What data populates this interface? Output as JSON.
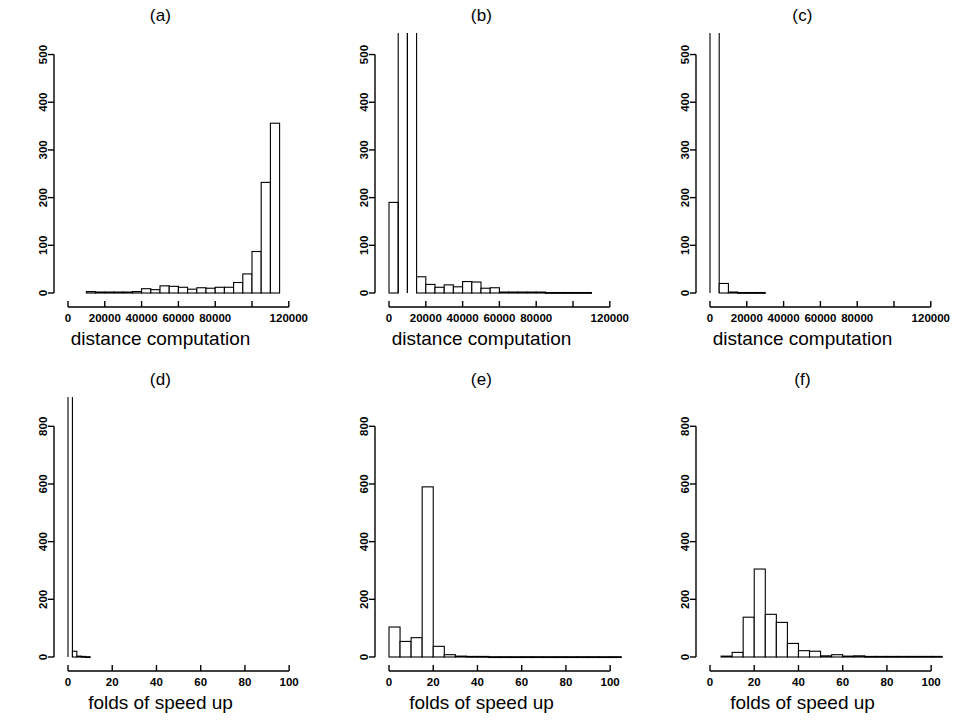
{
  "figure": {
    "background": "#ffffff",
    "axis_color": "#000000",
    "bar_fill": "#ffffff",
    "bar_stroke": "#000000",
    "width": 963,
    "height": 727
  },
  "panels": [
    {
      "id": "a",
      "title": "(a)"
    },
    {
      "id": "b",
      "title": "(b)"
    },
    {
      "id": "c",
      "title": "(c)"
    },
    {
      "id": "d",
      "title": "(d)"
    },
    {
      "id": "e",
      "title": "(e)"
    },
    {
      "id": "f",
      "title": "(f)"
    }
  ],
  "axis_labels": {
    "top_row_x": "distance computation",
    "bottom_row_x": "folds of speed up"
  },
  "chart_data": [
    {
      "type": "bar",
      "title": "(a)",
      "xlabel": "distance computation",
      "ylabel": "",
      "xlim": [
        0,
        125000
      ],
      "ylim": [
        0,
        520
      ],
      "xticks": [
        0,
        20000,
        40000,
        60000,
        80000,
        100000,
        120000
      ],
      "xtick_labels": [
        "0",
        "20000",
        "40000",
        "60000",
        "80000",
        "",
        "120000"
      ],
      "yticks": [
        0,
        100,
        200,
        300,
        400,
        500
      ],
      "ytick_labels": [
        "0",
        "100",
        "200",
        "300",
        "400",
        "500"
      ],
      "grid": false,
      "bin_width": 5000,
      "bin_starts": [
        10000,
        15000,
        20000,
        25000,
        30000,
        35000,
        40000,
        45000,
        50000,
        55000,
        60000,
        65000,
        70000,
        75000,
        80000,
        85000,
        90000,
        95000,
        100000,
        105000,
        110000
      ],
      "values": [
        3,
        2,
        2,
        2,
        2,
        3,
        9,
        7,
        15,
        14,
        12,
        8,
        11,
        10,
        12,
        12,
        22,
        40,
        87,
        232,
        356,
        5
      ]
    },
    {
      "type": "bar",
      "title": "(b)",
      "xlabel": "distance computation",
      "ylabel": "",
      "xlim": [
        0,
        125000
      ],
      "ylim": [
        0,
        520
      ],
      "xticks": [
        0,
        20000,
        40000,
        60000,
        80000,
        100000,
        120000
      ],
      "xtick_labels": [
        "0",
        "20000",
        "40000",
        "60000",
        "80000",
        "",
        "120000"
      ],
      "yticks": [
        0,
        100,
        200,
        300,
        400,
        500
      ],
      "ytick_labels": [
        "0",
        "100",
        "200",
        "300",
        "400",
        "500"
      ],
      "grid": false,
      "bin_width": 5000,
      "bin_starts": [
        0,
        5000,
        10000,
        15000,
        20000,
        25000,
        30000,
        35000,
        40000,
        45000,
        50000,
        55000,
        60000,
        65000,
        70000,
        75000,
        80000,
        85000,
        90000,
        95000,
        100000,
        105000
      ],
      "values": [
        190,
        900,
        900,
        34,
        18,
        12,
        17,
        13,
        24,
        23,
        10,
        11,
        2,
        2,
        2,
        2,
        2,
        1,
        1,
        1,
        1,
        1
      ],
      "clipped_bars": [
        1,
        2
      ],
      "note": "two bars exceed the plotted y range and are clipped at the top"
    },
    {
      "type": "bar",
      "title": "(c)",
      "xlabel": "distance computation",
      "ylabel": "",
      "xlim": [
        0,
        125000
      ],
      "ylim": [
        0,
        520
      ],
      "xticks": [
        0,
        20000,
        40000,
        60000,
        80000,
        100000,
        120000
      ],
      "xtick_labels": [
        "0",
        "20000",
        "40000",
        "60000",
        "80000",
        "",
        "120000"
      ],
      "yticks": [
        0,
        100,
        200,
        300,
        400,
        500
      ],
      "ytick_labels": [
        "0",
        "100",
        "200",
        "300",
        "400",
        "500"
      ],
      "grid": false,
      "bin_width": 5000,
      "bin_starts": [
        0,
        5000,
        10000,
        15000,
        20000,
        25000
      ],
      "values": [
        1100,
        20,
        2,
        1,
        1,
        1
      ],
      "clipped_bars": [
        0
      ],
      "note": "first bar exceeds the plotted y range and is clipped at the top"
    },
    {
      "type": "bar",
      "title": "(d)",
      "xlabel": "folds of speed up",
      "ylabel": "",
      "xlim": [
        0,
        104
      ],
      "ylim": [
        0,
        860
      ],
      "xticks": [
        0,
        20,
        40,
        60,
        80,
        100
      ],
      "xtick_labels": [
        "0",
        "20",
        "40",
        "60",
        "80",
        "100"
      ],
      "yticks": [
        0,
        200,
        400,
        600,
        800
      ],
      "ytick_labels": [
        "0",
        "200",
        "400",
        "600",
        "800"
      ],
      "grid": false,
      "bin_width": 2,
      "bin_starts": [
        0,
        2,
        4,
        6,
        8
      ],
      "values": [
        1150,
        20,
        3,
        2,
        1
      ],
      "clipped_bars": [
        0
      ],
      "note": "first bar exceeds the plotted y range and is clipped at the top"
    },
    {
      "type": "bar",
      "title": "(e)",
      "xlabel": "folds of speed up",
      "ylabel": "",
      "xlim": [
        0,
        104
      ],
      "ylim": [
        0,
        860
      ],
      "xticks": [
        0,
        20,
        40,
        60,
        80,
        100
      ],
      "xtick_labels": [
        "0",
        "20",
        "40",
        "60",
        "80",
        "100"
      ],
      "yticks": [
        0,
        200,
        400,
        600,
        800
      ],
      "ytick_labels": [
        "0",
        "200",
        "400",
        "600",
        "800"
      ],
      "grid": false,
      "bin_width": 5,
      "bin_starts": [
        0,
        5,
        10,
        15,
        20,
        25,
        30,
        35,
        40,
        45,
        50,
        55,
        60,
        65,
        70,
        75,
        80,
        85,
        90,
        95,
        100
      ],
      "values": [
        104,
        54,
        67,
        590,
        37,
        8,
        3,
        2,
        2,
        1,
        1,
        1,
        1,
        1,
        1,
        1,
        1,
        1,
        1,
        1,
        1
      ]
    },
    {
      "type": "bar",
      "title": "(f)",
      "xlabel": "folds of speed up",
      "ylabel": "",
      "xlim": [
        0,
        104
      ],
      "ylim": [
        0,
        860
      ],
      "xticks": [
        0,
        20,
        40,
        60,
        80,
        100
      ],
      "xtick_labels": [
        "0",
        "20",
        "40",
        "60",
        "80",
        "100"
      ],
      "yticks": [
        0,
        200,
        400,
        600,
        800
      ],
      "ytick_labels": [
        "0",
        "200",
        "400",
        "600",
        "800"
      ],
      "grid": false,
      "bin_width": 5,
      "bin_starts": [
        5,
        10,
        15,
        20,
        25,
        30,
        35,
        40,
        45,
        50,
        55,
        60,
        65,
        70,
        75,
        80,
        85,
        90,
        95,
        100
      ],
      "values": [
        3,
        16,
        138,
        305,
        148,
        120,
        47,
        22,
        20,
        4,
        8,
        3,
        4,
        2,
        2,
        2,
        2,
        2,
        2,
        2
      ]
    }
  ]
}
